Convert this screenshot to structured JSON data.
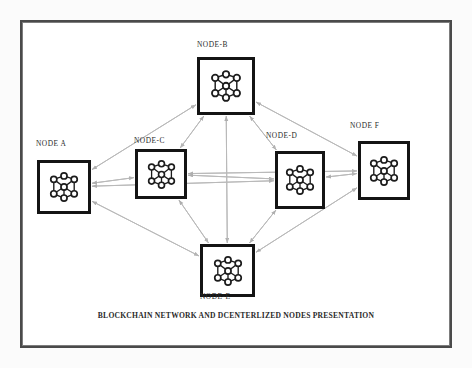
{
  "figure": {
    "caption": "BLOCKCHAIN NETWORK AND DCENTERLIZED NODES PRESENTATION",
    "background_color": "#fbfbfb",
    "frame_color": "#4a4a4a",
    "node_border_color": "#141414",
    "edge_color": "#b9b9b9",
    "icon_name": "network-nodes-icon"
  },
  "nodes": [
    {
      "id": "A",
      "label": "NODE A",
      "icon": "network-nodes-icon",
      "box": {
        "x": 37,
        "y": 160,
        "w": 54,
        "h": 54
      },
      "label_pos": {
        "x": 36,
        "y": 139
      }
    },
    {
      "id": "B",
      "label": "NODE-B",
      "icon": "network-nodes-icon",
      "box": {
        "x": 197,
        "y": 57,
        "w": 58,
        "h": 58
      },
      "label_pos": {
        "x": 197,
        "y": 40
      }
    },
    {
      "id": "C",
      "label": "NODE-C",
      "icon": "network-nodes-icon",
      "box": {
        "x": 135,
        "y": 149,
        "w": 52,
        "h": 50
      },
      "label_pos": {
        "x": 134,
        "y": 136
      }
    },
    {
      "id": "D",
      "label": "NODE-D",
      "icon": "network-nodes-icon",
      "box": {
        "x": 275,
        "y": 151,
        "w": 50,
        "h": 58
      },
      "label_pos": {
        "x": 266,
        "y": 131
      }
    },
    {
      "id": "E",
      "label": "NODE-E",
      "icon": "network-nodes-icon",
      "box": {
        "x": 200,
        "y": 244,
        "w": 55,
        "h": 53
      },
      "label_pos": {
        "x": 200,
        "y": 292
      }
    },
    {
      "id": "F",
      "label": "NODE F",
      "icon": "network-nodes-icon",
      "box": {
        "x": 358,
        "y": 141,
        "w": 52,
        "h": 59
      },
      "label_pos": {
        "x": 350,
        "y": 121
      }
    }
  ],
  "edges": [
    {
      "from": "A",
      "to": "B"
    },
    {
      "from": "A",
      "to": "C"
    },
    {
      "from": "A",
      "to": "D"
    },
    {
      "from": "A",
      "to": "E"
    },
    {
      "from": "B",
      "to": "C"
    },
    {
      "from": "B",
      "to": "D"
    },
    {
      "from": "B",
      "to": "E"
    },
    {
      "from": "B",
      "to": "F"
    },
    {
      "from": "C",
      "to": "D"
    },
    {
      "from": "C",
      "to": "E"
    },
    {
      "from": "D",
      "to": "E"
    },
    {
      "from": "D",
      "to": "F"
    },
    {
      "from": "E",
      "to": "F"
    },
    {
      "from": "C",
      "to": "F"
    }
  ]
}
